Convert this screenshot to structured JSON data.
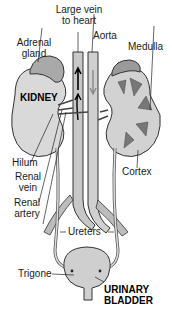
{
  "diagram": {
    "labels": {
      "large_vein_line1": "Large vein",
      "large_vein_line2": "to heart",
      "aorta": "Aorta",
      "adrenal_line1": "Adrenal",
      "adrenal_line2": "gland",
      "medulla": "Medulla",
      "kidney": "KIDNEY",
      "hilum": "Hilum",
      "cortex": "Cortex",
      "renal_vein_line1": "Renal",
      "renal_vein_line2": "vein",
      "renal_artery_line1": "Renal",
      "renal_artery_line2": "artery",
      "ureters": "Ureters",
      "trigone": "Trigone",
      "bladder_line1": "URINARY",
      "bladder_line2": "BLADDER"
    },
    "colors": {
      "organ_fill": "#d6d6d6",
      "organ_dark": "#8a8a8a",
      "vessel_fill": "#c8c8c8",
      "outline": "#333333",
      "text": "#1a1a1a"
    }
  }
}
